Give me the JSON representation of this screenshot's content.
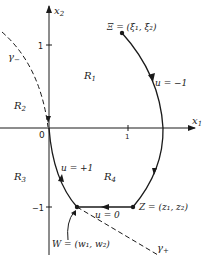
{
  "figure": {
    "axes": {
      "x_label": "x",
      "x_sub": "1",
      "y_label": "x",
      "y_sub": "2",
      "origin_label": "0",
      "ticks": {
        "x1_pos": "1",
        "x2_pos": "1",
        "x2_neg": "−1"
      }
    },
    "regions": [
      {
        "name": "R",
        "sub": "1"
      },
      {
        "name": "R",
        "sub": "2"
      },
      {
        "name": "R",
        "sub": "3"
      },
      {
        "name": "R",
        "sub": "4"
      }
    ],
    "curves": {
      "gamma_minus": {
        "sym": "γ",
        "sub": "−"
      },
      "gamma_plus": {
        "sym": "γ",
        "sub": "+"
      }
    },
    "controls": {
      "u_minus": "u = −1",
      "u_plus": "u = +1",
      "u_zero": "u = 0"
    },
    "points": {
      "xi": "Ξ = (ξ₁, ξ₂)",
      "z": "Z = (z₁, z₂)",
      "w": "W = (w₁, w₂)"
    },
    "colors": {
      "ink": "#1a1a1a",
      "background": "#ffffff"
    }
  }
}
